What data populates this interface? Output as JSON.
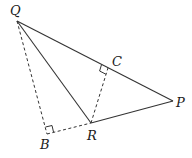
{
  "diagram": {
    "type": "geometry",
    "colors": {
      "stroke": "#333333",
      "label": "#1a1a1a",
      "background": "#ffffff"
    },
    "points": {
      "Q": {
        "label": "Q",
        "x": 17,
        "y": 21
      },
      "P": {
        "label": "P",
        "x": 173,
        "y": 101
      },
      "R": {
        "label": "R",
        "x": 91,
        "y": 123
      },
      "B": {
        "label": "B",
        "x": 47,
        "y": 134
      },
      "C": {
        "label": "C",
        "x": 108,
        "y": 68
      }
    },
    "segments": [
      {
        "from": "Q",
        "to": "P",
        "style": "solid"
      },
      {
        "from": "Q",
        "to": "R",
        "style": "solid"
      },
      {
        "from": "R",
        "to": "P",
        "style": "solid"
      },
      {
        "from": "Q",
        "to": "B",
        "style": "dashed"
      },
      {
        "from": "B",
        "to": "R",
        "style": "dashed"
      },
      {
        "from": "R",
        "to": "C",
        "style": "dashed"
      }
    ],
    "right_angles": [
      "B",
      "C"
    ]
  }
}
